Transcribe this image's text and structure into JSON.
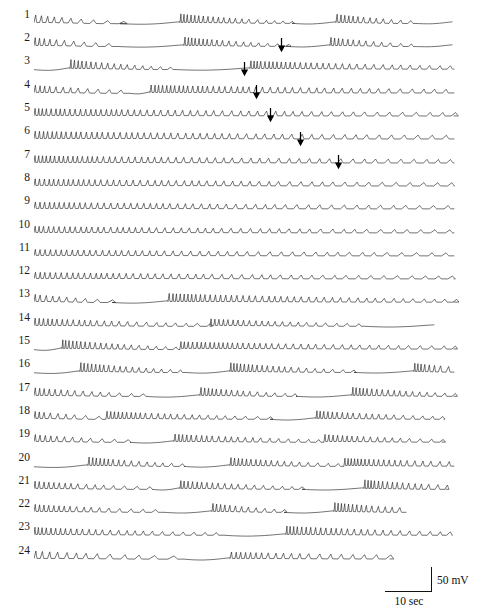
{
  "figure": {
    "trace_count": 24,
    "row_spacing_px": 23.3,
    "first_row_baseline_px": 22,
    "trace_left_px": 34,
    "trace_width_px": 430,
    "stroke_color": "#1c1c1c",
    "background_color": "#ffffff"
  },
  "scalebar": {
    "voltage_label": "50 mV",
    "time_label": "10 sec",
    "left_px": 385,
    "top_px": 567,
    "h_length_px": 47,
    "v_length_px": 24
  },
  "rows": [
    {
      "label": "1",
      "arrow": null
    },
    {
      "label": "2",
      "arrow": null
    },
    {
      "label": "3",
      "arrow": 247
    },
    {
      "label": "4",
      "arrow": 210
    },
    {
      "label": "5",
      "arrow": 222
    },
    {
      "label": "6",
      "arrow": 236
    },
    {
      "label": "7",
      "arrow": 266
    },
    {
      "label": "8",
      "arrow": 304
    },
    {
      "label": "9",
      "arrow": null
    },
    {
      "label": "10",
      "arrow": null
    },
    {
      "label": "11",
      "arrow": null
    },
    {
      "label": "12",
      "arrow": null
    },
    {
      "label": "13",
      "arrow": null
    },
    {
      "label": "14",
      "arrow": null
    },
    {
      "label": "15",
      "arrow": null
    },
    {
      "label": "16",
      "arrow": null
    },
    {
      "label": "17",
      "arrow": null
    },
    {
      "label": "18",
      "arrow": null
    },
    {
      "label": "19",
      "arrow": null
    },
    {
      "label": "20",
      "arrow": null
    },
    {
      "label": "21",
      "arrow": null
    },
    {
      "label": "22",
      "arrow": null
    },
    {
      "label": "23",
      "arrow": null
    },
    {
      "label": "24",
      "arrow": null
    }
  ],
  "chart_data": {
    "type": "line",
    "title": "",
    "xlabel": "10 sec",
    "ylabel": "50 mV",
    "x_units": "seconds",
    "y_units": "millivolts",
    "x_scale_bar_seconds": 10,
    "y_scale_bar_millivolts": 50,
    "series": [
      {
        "name": "trace 1",
        "segments": [
          {
            "kind": "spikes",
            "x0": 0,
            "x1": 86,
            "amp_start": 7.2,
            "amp_end": 2.0,
            "rate": 5.2,
            "drift": 0.7
          },
          {
            "kind": "silent",
            "x0": 86,
            "x1": 146,
            "dip": 2.4
          },
          {
            "kind": "spikes",
            "x0": 146,
            "x1": 258,
            "amp_start": 8.4,
            "amp_end": 1.6,
            "rate": 3.1,
            "drift": 0.5
          },
          {
            "kind": "silent",
            "x0": 258,
            "x1": 302,
            "dip": 2.0
          },
          {
            "kind": "spikes",
            "x0": 302,
            "x1": 382,
            "amp_start": 8.0,
            "amp_end": 2.2,
            "rate": 3.4,
            "drift": 0.6
          },
          {
            "kind": "silent",
            "x0": 382,
            "x1": 418,
            "dip": 1.6
          }
        ]
      },
      {
        "name": "trace 2",
        "segments": [
          {
            "kind": "spikes",
            "x0": 0,
            "x1": 84,
            "amp_start": 7.6,
            "amp_end": 2.2,
            "rate": 4.6,
            "drift": 0.6
          },
          {
            "kind": "silent",
            "x0": 84,
            "x1": 150,
            "dip": 2.2
          },
          {
            "kind": "spikes",
            "x0": 150,
            "x1": 252,
            "amp_start": 8.2,
            "amp_end": 1.8,
            "rate": 3.2,
            "drift": 0.5
          },
          {
            "kind": "silent",
            "x0": 252,
            "x1": 296,
            "dip": 1.9
          },
          {
            "kind": "spikes",
            "x0": 296,
            "x1": 380,
            "amp_start": 7.8,
            "amp_end": 2.0,
            "rate": 3.5,
            "drift": 0.6
          },
          {
            "kind": "silent",
            "x0": 380,
            "x1": 418,
            "dip": 1.5
          }
        ]
      },
      {
        "name": "trace 3",
        "segments": [
          {
            "kind": "silent",
            "x0": 0,
            "x1": 36,
            "dip": 2.6
          },
          {
            "kind": "spikes",
            "x0": 36,
            "x1": 140,
            "amp_start": 8.6,
            "amp_end": 1.8,
            "rate": 3.3,
            "drift": 0.6
          },
          {
            "kind": "silent",
            "x0": 140,
            "x1": 216,
            "dip": 2.3
          },
          {
            "kind": "spikes",
            "x0": 216,
            "x1": 420,
            "amp_start": 7.4,
            "amp_end": 3.0,
            "rate": 3.4,
            "drift": 0.4
          }
        ]
      },
      {
        "name": "trace 4",
        "segments": [
          {
            "kind": "spikes",
            "x0": 0,
            "x1": 96,
            "amp_start": 7.0,
            "amp_end": 2.6,
            "rate": 4.2,
            "drift": 0.5
          },
          {
            "kind": "silent",
            "x0": 96,
            "x1": 116,
            "dip": 1.8
          },
          {
            "kind": "spikes",
            "x0": 116,
            "x1": 420,
            "amp_start": 7.2,
            "amp_end": 3.4,
            "rate": 3.6,
            "drift": 0.3
          }
        ]
      },
      {
        "name": "trace 5",
        "segments": [
          {
            "kind": "spikes",
            "x0": 0,
            "x1": 420,
            "amp_start": 6.8,
            "amp_end": 3.2,
            "rate": 4.0,
            "drift": 0.3
          }
        ]
      },
      {
        "name": "trace 6",
        "segments": [
          {
            "kind": "spikes",
            "x0": 0,
            "x1": 420,
            "amp_start": 7.0,
            "amp_end": 3.4,
            "rate": 4.0,
            "drift": 0.3
          }
        ]
      },
      {
        "name": "trace 7",
        "segments": [
          {
            "kind": "spikes",
            "x0": 0,
            "x1": 420,
            "amp_start": 6.6,
            "amp_end": 3.2,
            "rate": 4.1,
            "drift": 0.3
          }
        ]
      },
      {
        "name": "trace 8",
        "segments": [
          {
            "kind": "spikes",
            "x0": 0,
            "x1": 420,
            "amp_start": 6.4,
            "amp_end": 3.0,
            "rate": 4.2,
            "drift": 0.3
          }
        ]
      },
      {
        "name": "trace 9",
        "segments": [
          {
            "kind": "spikes",
            "x0": 0,
            "x1": 420,
            "amp_start": 6.2,
            "amp_end": 3.0,
            "rate": 4.3,
            "drift": 0.25
          }
        ]
      },
      {
        "name": "trace 10",
        "segments": [
          {
            "kind": "spikes",
            "x0": 0,
            "x1": 420,
            "amp_start": 6.0,
            "amp_end": 2.8,
            "rate": 4.4,
            "drift": 0.25
          }
        ]
      },
      {
        "name": "trace 11",
        "segments": [
          {
            "kind": "spikes",
            "x0": 0,
            "x1": 420,
            "amp_start": 5.8,
            "amp_end": 2.8,
            "rate": 4.5,
            "drift": 0.25
          }
        ]
      },
      {
        "name": "trace 12",
        "segments": [
          {
            "kind": "spikes",
            "x0": 0,
            "x1": 420,
            "amp_start": 6.0,
            "amp_end": 2.6,
            "rate": 4.4,
            "drift": 0.25
          }
        ]
      },
      {
        "name": "trace 13",
        "segments": [
          {
            "kind": "spikes",
            "x0": 0,
            "x1": 78,
            "amp_start": 6.8,
            "amp_end": 2.2,
            "rate": 4.6,
            "drift": 0.6
          },
          {
            "kind": "silent",
            "x0": 78,
            "x1": 134,
            "dip": 2.2
          },
          {
            "kind": "spikes",
            "x0": 134,
            "x1": 420,
            "amp_start": 7.8,
            "amp_end": 2.6,
            "rate": 3.6,
            "drift": 0.4
          }
        ]
      },
      {
        "name": "trace 14",
        "segments": [
          {
            "kind": "spikes",
            "x0": 0,
            "x1": 176,
            "amp_start": 7.2,
            "amp_end": 2.4,
            "rate": 3.8,
            "drift": 0.5
          },
          {
            "kind": "spikes",
            "x0": 176,
            "x1": 330,
            "amp_start": 6.4,
            "amp_end": 2.2,
            "rate": 3.8,
            "drift": 0.45
          },
          {
            "kind": "silent",
            "x0": 330,
            "x1": 400,
            "dip": 2.0
          }
        ]
      },
      {
        "name": "trace 15",
        "segments": [
          {
            "kind": "silent",
            "x0": 0,
            "x1": 28,
            "dip": 2.6
          },
          {
            "kind": "spikes",
            "x0": 28,
            "x1": 146,
            "amp_start": 8.4,
            "amp_end": 2.0,
            "rate": 3.2,
            "drift": 0.6
          },
          {
            "kind": "spikes",
            "x0": 146,
            "x1": 420,
            "amp_start": 6.6,
            "amp_end": 2.8,
            "rate": 3.6,
            "drift": 0.35
          }
        ]
      },
      {
        "name": "trace 16",
        "segments": [
          {
            "kind": "silent",
            "x0": 0,
            "x1": 46,
            "dip": 2.8
          },
          {
            "kind": "spikes",
            "x0": 46,
            "x1": 152,
            "amp_start": 8.6,
            "amp_end": 2.0,
            "rate": 3.1,
            "drift": 0.6
          },
          {
            "kind": "silent",
            "x0": 152,
            "x1": 196,
            "dip": 2.2
          },
          {
            "kind": "spikes",
            "x0": 196,
            "x1": 320,
            "amp_start": 8.4,
            "amp_end": 2.0,
            "rate": 3.2,
            "drift": 0.55
          },
          {
            "kind": "silent",
            "x0": 320,
            "x1": 380,
            "dip": 2.0
          },
          {
            "kind": "spikes",
            "x0": 380,
            "x1": 420,
            "amp_start": 8.0,
            "amp_end": 5.0,
            "rate": 2.8,
            "drift": 0.4
          }
        ]
      },
      {
        "name": "trace 17",
        "segments": [
          {
            "kind": "spikes",
            "x0": 0,
            "x1": 112,
            "amp_start": 7.4,
            "amp_end": 2.2,
            "rate": 4.0,
            "drift": 0.55
          },
          {
            "kind": "silent",
            "x0": 112,
            "x1": 166,
            "dip": 2.2
          },
          {
            "kind": "spikes",
            "x0": 166,
            "x1": 262,
            "amp_start": 7.8,
            "amp_end": 2.2,
            "rate": 3.4,
            "drift": 0.5
          },
          {
            "kind": "silent",
            "x0": 262,
            "x1": 318,
            "dip": 2.0
          },
          {
            "kind": "spikes",
            "x0": 318,
            "x1": 420,
            "amp_start": 8.0,
            "amp_end": 2.6,
            "rate": 3.2,
            "drift": 0.5
          }
        ]
      },
      {
        "name": "trace 18",
        "segments": [
          {
            "kind": "spikes",
            "x0": 0,
            "x1": 72,
            "amp_start": 6.8,
            "amp_end": 2.4,
            "rate": 4.4,
            "drift": 0.5
          },
          {
            "kind": "spikes",
            "x0": 72,
            "x1": 236,
            "amp_start": 7.0,
            "amp_end": 2.2,
            "rate": 3.6,
            "drift": 0.45
          },
          {
            "kind": "silent",
            "x0": 236,
            "x1": 282,
            "dip": 2.0
          },
          {
            "kind": "spikes",
            "x0": 282,
            "x1": 410,
            "amp_start": 7.4,
            "amp_end": 2.4,
            "rate": 3.4,
            "drift": 0.45
          }
        ]
      },
      {
        "name": "trace 19",
        "segments": [
          {
            "kind": "spikes",
            "x0": 0,
            "x1": 96,
            "amp_start": 6.6,
            "amp_end": 2.2,
            "rate": 4.4,
            "drift": 0.5
          },
          {
            "kind": "silent",
            "x0": 96,
            "x1": 140,
            "dip": 2.0
          },
          {
            "kind": "spikes",
            "x0": 140,
            "x1": 290,
            "amp_start": 7.2,
            "amp_end": 2.2,
            "rate": 3.6,
            "drift": 0.45
          },
          {
            "kind": "spikes",
            "x0": 290,
            "x1": 408,
            "amp_start": 6.8,
            "amp_end": 2.4,
            "rate": 3.6,
            "drift": 0.4
          }
        ]
      },
      {
        "name": "trace 20",
        "segments": [
          {
            "kind": "silent",
            "x0": 0,
            "x1": 54,
            "dip": 2.8
          },
          {
            "kind": "spikes",
            "x0": 54,
            "x1": 150,
            "amp_start": 8.2,
            "amp_end": 2.2,
            "rate": 3.3,
            "drift": 0.55
          },
          {
            "kind": "silent",
            "x0": 150,
            "x1": 196,
            "dip": 2.2
          },
          {
            "kind": "spikes",
            "x0": 196,
            "x1": 310,
            "amp_start": 7.6,
            "amp_end": 2.2,
            "rate": 3.4,
            "drift": 0.5
          },
          {
            "kind": "spikes",
            "x0": 310,
            "x1": 420,
            "amp_start": 7.0,
            "amp_end": 4.2,
            "rate": 3.0,
            "drift": 0.4
          }
        ]
      },
      {
        "name": "trace 21",
        "segments": [
          {
            "kind": "spikes",
            "x0": 0,
            "x1": 118,
            "amp_start": 7.0,
            "amp_end": 2.2,
            "rate": 4.0,
            "drift": 0.5
          },
          {
            "kind": "silent",
            "x0": 118,
            "x1": 146,
            "dip": 2.0
          },
          {
            "kind": "spikes",
            "x0": 146,
            "x1": 268,
            "amp_start": 7.6,
            "amp_end": 2.2,
            "rate": 3.4,
            "drift": 0.5
          },
          {
            "kind": "silent",
            "x0": 268,
            "x1": 330,
            "dip": 2.0
          },
          {
            "kind": "spikes",
            "x0": 330,
            "x1": 412,
            "amp_start": 8.4,
            "amp_end": 4.0,
            "rate": 2.9,
            "drift": 0.5
          }
        ]
      },
      {
        "name": "trace 22",
        "segments": [
          {
            "kind": "spikes",
            "x0": 0,
            "x1": 130,
            "amp_start": 6.8,
            "amp_end": 2.2,
            "rate": 4.0,
            "drift": 0.5
          },
          {
            "kind": "silent",
            "x0": 130,
            "x1": 178,
            "dip": 2.0
          },
          {
            "kind": "spikes",
            "x0": 178,
            "x1": 250,
            "amp_start": 7.8,
            "amp_end": 2.4,
            "rate": 3.4,
            "drift": 0.5
          },
          {
            "kind": "silent",
            "x0": 250,
            "x1": 300,
            "dip": 2.0
          },
          {
            "kind": "spikes",
            "x0": 300,
            "x1": 372,
            "amp_start": 8.6,
            "amp_end": 4.2,
            "rate": 2.8,
            "drift": 0.5
          }
        ]
      },
      {
        "name": "trace 23",
        "segments": [
          {
            "kind": "spikes",
            "x0": 0,
            "x1": 190,
            "amp_start": 7.0,
            "amp_end": 2.2,
            "rate": 3.8,
            "drift": 0.45
          },
          {
            "kind": "silent",
            "x0": 190,
            "x1": 252,
            "dip": 2.2
          },
          {
            "kind": "spikes",
            "x0": 252,
            "x1": 418,
            "amp_start": 8.2,
            "amp_end": 3.0,
            "rate": 3.3,
            "drift": 0.45
          }
        ]
      },
      {
        "name": "trace 24",
        "segments": [
          {
            "kind": "spikes",
            "x0": 0,
            "x1": 150,
            "amp_start": 7.2,
            "amp_end": 2.6,
            "rate": 6.2,
            "drift": 0.4
          },
          {
            "kind": "silent",
            "x0": 150,
            "x1": 196,
            "dip": 2.0
          },
          {
            "kind": "spikes",
            "x0": 196,
            "x1": 356,
            "amp_start": 6.2,
            "amp_end": 3.8,
            "rate": 4.6,
            "drift": 0.3
          }
        ]
      }
    ]
  }
}
